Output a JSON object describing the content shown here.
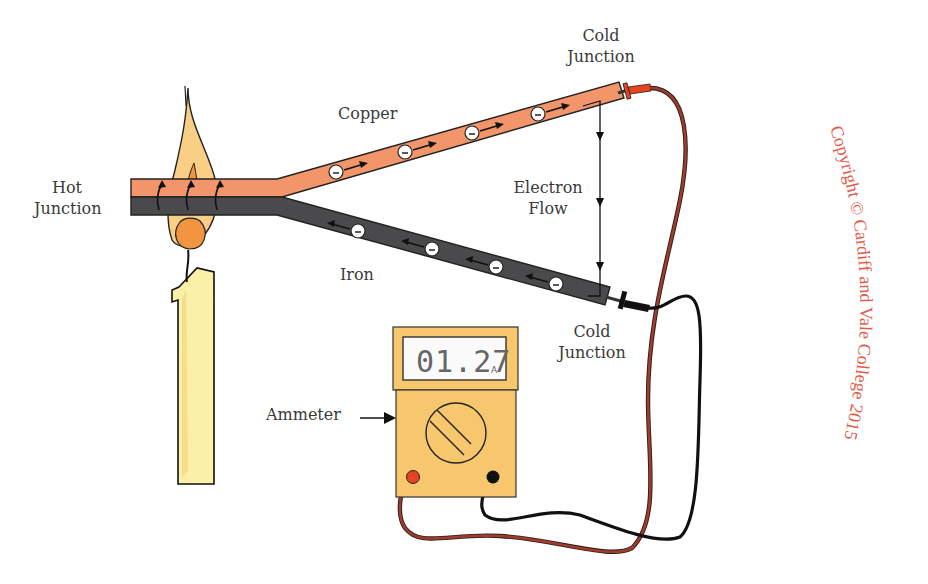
{
  "diagram": {
    "labels": {
      "hot_junction": [
        "Hot",
        "Junction"
      ],
      "cold_junction_top": [
        "Cold",
        "Junction"
      ],
      "cold_junction_bottom": [
        "Cold",
        "Junction"
      ],
      "copper": "Copper",
      "iron": "Iron",
      "electron_flow": [
        "Electron",
        "Flow"
      ],
      "ammeter": "Ammeter"
    },
    "ammeter": {
      "reading": "01.27",
      "unit": "A"
    },
    "electron_symbol": "−",
    "copyright": "Copyright © Cardiff and Vale College 2015",
    "colors": {
      "copper": "#f2956a",
      "iron": "#4a4a4c",
      "flame_outer": "#f9cf86",
      "flame_inner": "#f29540",
      "candle": "#faf0a8",
      "meter_body": "#f7c76e",
      "red_lead": "#a33a2a",
      "red_probe": "#e8431f",
      "black_lead": "#111111",
      "watermark": "#e25a4a",
      "label_text": "#3a3a3a"
    }
  }
}
